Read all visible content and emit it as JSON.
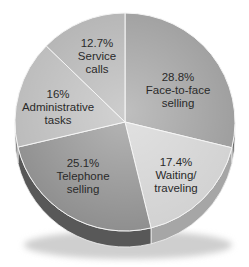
{
  "chart_data": {
    "type": "pie",
    "title": "",
    "style": "3d",
    "slices": [
      {
        "label": "Face-to-face selling",
        "value": 28.8,
        "display": "28.8%",
        "lines": [
          "Face-to-face",
          "selling"
        ],
        "color": "#9c9c9c",
        "side_color": "#6e6e6e"
      },
      {
        "label": "Waiting/traveling",
        "value": 17.4,
        "display": "17.4%",
        "lines": [
          "Waiting/",
          "traveling"
        ],
        "color": "#d2d2d2",
        "side_color": "#a6a6a6"
      },
      {
        "label": "Telephone selling",
        "value": 25.1,
        "display": "25.1%",
        "lines": [
          "Telephone",
          "selling"
        ],
        "color": "#8f8f8f",
        "side_color": "#585858"
      },
      {
        "label": "Administrative tasks",
        "value": 16.0,
        "display": "16%",
        "lines": [
          "Administrative",
          "tasks"
        ],
        "color": "#bababa",
        "side_color": "#8a8a8a"
      },
      {
        "label": "Service calls",
        "value": 12.7,
        "display": "12.7%",
        "lines": [
          "Service",
          "calls"
        ],
        "color": "#b2b2b2",
        "side_color": "#848484"
      }
    ],
    "start_angle_deg": 0,
    "direction": "clockwise",
    "legend": "none",
    "labels_inside": true
  },
  "labels": [
    {
      "pct": "28.8%",
      "line1": "Face-to-face",
      "line2": "selling"
    },
    {
      "pct": "17.4%",
      "line1": "Waiting/",
      "line2": "traveling"
    },
    {
      "pct": "25.1%",
      "line1": "Telephone",
      "line2": "selling"
    },
    {
      "pct": "16%",
      "line1": "Administrative",
      "line2": "tasks"
    },
    {
      "pct": "12.7%",
      "line1": "Service",
      "line2": "calls"
    }
  ]
}
